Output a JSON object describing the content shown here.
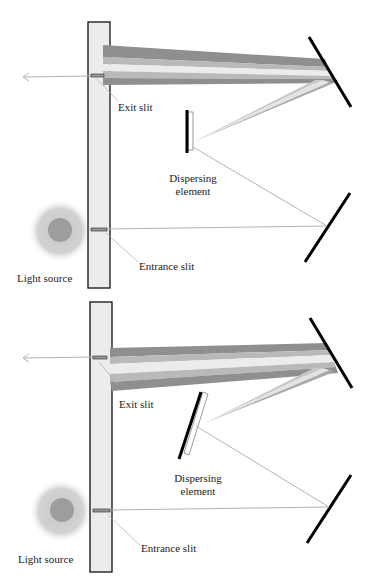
{
  "diagram": {
    "type": "monochromator schematic (Czerny-Turner), two configurations",
    "colors": {
      "housing_fill": "#ececec",
      "housing_stroke": "#111111",
      "mirror": "#000000",
      "ray": "#b0b0b0",
      "beam_dark": "#8f8f8f",
      "beam_mid": "#b9b9b9",
      "beam_light": "#e6e6e6",
      "source_outer": "#cfcfcf",
      "source_inner": "#9a9a9a"
    },
    "panels": [
      {
        "id": "top",
        "labels": {
          "exit_slit": "Exit slit",
          "dispersing_element": [
            "Dispersing",
            "element"
          ],
          "entrance_slit": "Entrance slit",
          "light_source": "Light source"
        },
        "dispersing_element_orientation": "vertical"
      },
      {
        "id": "bottom",
        "labels": {
          "exit_slit": "Exit slit",
          "dispersing_element": [
            "Dispersing",
            "element"
          ],
          "entrance_slit": "Entrance slit",
          "light_source": "Light source"
        },
        "dispersing_element_orientation": "rotated"
      }
    ]
  }
}
